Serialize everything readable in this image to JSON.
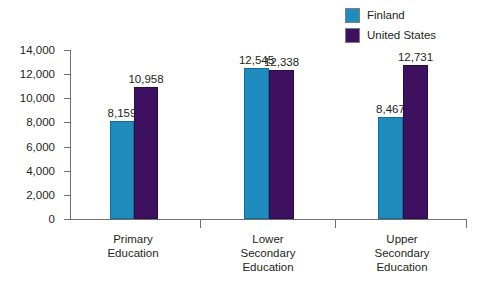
{
  "chart_data": {
    "type": "bar",
    "title": "",
    "subtitle": "",
    "xlabel": "",
    "ylabel": "",
    "ylim": [
      0,
      14000
    ],
    "ytick_step": 2000,
    "grid": false,
    "legend_position": "top-right",
    "categories": [
      "Primary Education",
      "Lower Secondary Education",
      "Upper Secondary Education"
    ],
    "category_lines": [
      [
        "Primary",
        "Education"
      ],
      [
        "Lower",
        "Secondary",
        "Education"
      ],
      [
        "Upper",
        "Secondary",
        "Education"
      ]
    ],
    "ytick_labels": [
      "14,000",
      "12,000",
      "10,000",
      "8,000",
      "6,000",
      "4,000",
      "2,000",
      "0"
    ],
    "ytick_values": [
      14000,
      12000,
      10000,
      8000,
      6000,
      4000,
      2000,
      0
    ],
    "series": [
      {
        "name": "Finland",
        "color": "#1f8cbd",
        "values": [
          8159,
          12545,
          8467
        ],
        "labels": [
          "8,159",
          "12,545",
          "8,467"
        ]
      },
      {
        "name": "United States",
        "color": "#3d1160",
        "values": [
          10958,
          12338,
          12731
        ],
        "labels": [
          "10,958",
          "12,338",
          "12,731"
        ]
      }
    ]
  },
  "legend": {
    "entries": [
      {
        "label": "Finland",
        "color": "#1f8cbd"
      },
      {
        "label": "United States",
        "color": "#3d1160"
      }
    ]
  },
  "colors": {
    "finland": "#1f8cbd",
    "united_states": "#3d1160",
    "axis": "#6f6f74",
    "text": "#231f20",
    "background": "#ffffff"
  }
}
